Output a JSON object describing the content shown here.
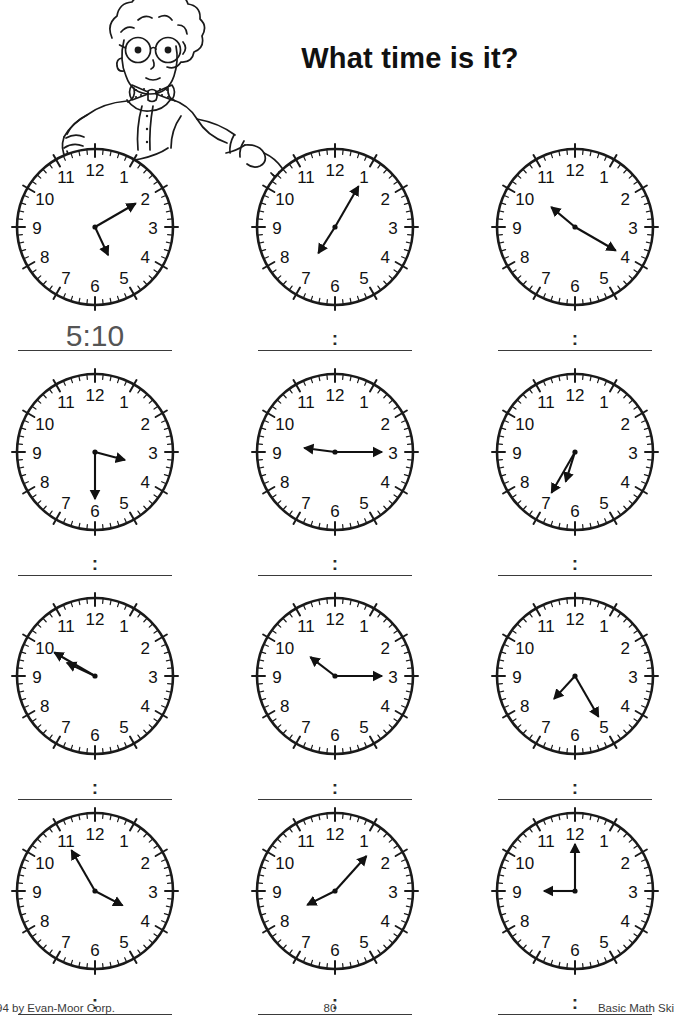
{
  "page": {
    "title": "What time is it?",
    "background_color": "#ffffff",
    "ink_color": "#1a1a1a"
  },
  "mascot": {
    "name": "boy-with-glasses-pointing",
    "description": "Cartoon boy with curly hair, round glasses and polka-dot bow tie leaning on the first clock and pointing to the right"
  },
  "chart_data": {
    "type": "table",
    "title": "What time is it?",
    "xlabel": "",
    "ylabel": "",
    "columns": [
      "Clock",
      "Hour hand",
      "Minute hand",
      "Time"
    ],
    "rows": [
      [
        "1",
        5,
        10,
        "5:10"
      ],
      [
        "2",
        7,
        5,
        "7:05"
      ],
      [
        "3",
        10,
        20,
        "10:20"
      ],
      [
        "4",
        3,
        30,
        "3:30"
      ],
      [
        "5",
        9,
        15,
        "9:15"
      ],
      [
        "6",
        6,
        35,
        "6:35"
      ],
      [
        "7",
        9,
        50,
        "9:50"
      ],
      [
        "8",
        10,
        15,
        "10:15"
      ],
      [
        "9",
        7,
        25,
        "7:25"
      ],
      [
        "10",
        3,
        55,
        "3:55"
      ],
      [
        "11",
        8,
        7,
        "8:07"
      ],
      [
        "12",
        9,
        0,
        "9:00"
      ]
    ]
  },
  "clock_numerals": [
    "12",
    "1",
    "2",
    "3",
    "4",
    "5",
    "6",
    "7",
    "8",
    "9",
    "10",
    "11"
  ],
  "clocks": [
    {
      "id": "clock-1",
      "hour": 5,
      "minute": 10,
      "answer": "5:10",
      "answer_filled": true,
      "answer_placeholder": ":"
    },
    {
      "id": "clock-2",
      "hour": 7,
      "minute": 5,
      "answer": "7:05",
      "answer_filled": false,
      "answer_placeholder": ":"
    },
    {
      "id": "clock-3",
      "hour": 10,
      "minute": 20,
      "answer": "10:20",
      "answer_filled": false,
      "answer_placeholder": ":"
    },
    {
      "id": "clock-4",
      "hour": 3,
      "minute": 30,
      "answer": "3:30",
      "answer_filled": false,
      "answer_placeholder": ":"
    },
    {
      "id": "clock-5",
      "hour": 9,
      "minute": 15,
      "answer": "9:15",
      "answer_filled": false,
      "answer_placeholder": ":"
    },
    {
      "id": "clock-6",
      "hour": 6,
      "minute": 35,
      "answer": "6:35",
      "answer_filled": false,
      "answer_placeholder": ":"
    },
    {
      "id": "clock-7",
      "hour": 9,
      "minute": 50,
      "answer": "9:50",
      "answer_filled": false,
      "answer_placeholder": ":"
    },
    {
      "id": "clock-8",
      "hour": 10,
      "minute": 15,
      "answer": "10:15",
      "answer_filled": false,
      "answer_placeholder": ":"
    },
    {
      "id": "clock-9",
      "hour": 7,
      "minute": 25,
      "answer": "7:25",
      "answer_filled": false,
      "answer_placeholder": ":"
    },
    {
      "id": "clock-10",
      "hour": 3,
      "minute": 55,
      "answer": "3:55",
      "answer_filled": false,
      "answer_placeholder": ":"
    },
    {
      "id": "clock-11",
      "hour": 8,
      "minute": 7,
      "answer": "8:07",
      "answer_filled": false,
      "answer_placeholder": ":"
    },
    {
      "id": "clock-12",
      "hour": 9,
      "minute": 0,
      "answer": "9:00",
      "answer_filled": false,
      "answer_placeholder": ":"
    }
  ],
  "footer": {
    "copyright": "94 by Evan-Moor Corp.",
    "page_number": "80",
    "book_title": "Basic Math Ski"
  }
}
